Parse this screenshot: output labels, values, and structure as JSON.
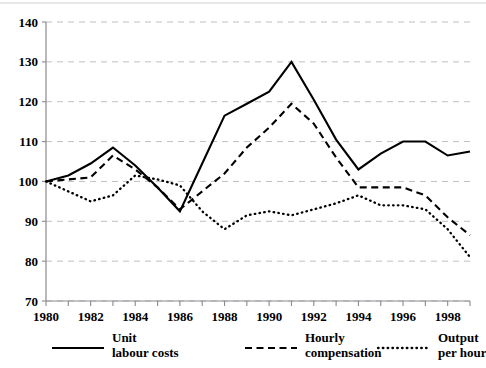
{
  "chart_data": {
    "type": "line",
    "title": "",
    "subtitle": "",
    "xlabel": "",
    "ylabel": "",
    "xlim": [
      1980,
      1999
    ],
    "ylim": [
      70,
      140
    ],
    "yticks": [
      70,
      80,
      90,
      100,
      110,
      120,
      130,
      140
    ],
    "xticks": [
      1980,
      1982,
      1984,
      1986,
      1988,
      1990,
      1992,
      1994,
      1996,
      1998
    ],
    "xtick_minor": [
      1981,
      1983,
      1985,
      1987,
      1989,
      1991,
      1993,
      1995,
      1997,
      1999
    ],
    "grid": true,
    "legend_position": "bottom",
    "x": [
      1980,
      1981,
      1982,
      1983,
      1984,
      1985,
      1986,
      1987,
      1988,
      1989,
      1990,
      1991,
      1992,
      1993,
      1994,
      1995,
      1996,
      1997,
      1998,
      1999
    ],
    "series": [
      {
        "name": "Unit labour costs",
        "style": "solid",
        "values": [
          100.0,
          101.5,
          104.5,
          108.5,
          104.0,
          98.5,
          92.5,
          104.5,
          116.5,
          119.5,
          122.5,
          130.0,
          120.5,
          110.5,
          103.0,
          107.0,
          110.0,
          110.0,
          106.5,
          107.5
        ]
      },
      {
        "name": "Hourly compensation",
        "style": "dashed",
        "values": [
          100.0,
          100.5,
          101.0,
          106.5,
          103.0,
          98.5,
          93.0,
          97.5,
          102.0,
          108.5,
          113.5,
          119.5,
          114.5,
          106.0,
          98.5,
          98.5,
          98.5,
          96.5,
          91.0,
          86.5
        ]
      },
      {
        "name": "Output per hour",
        "style": "dotted",
        "values": [
          100.0,
          97.5,
          95.0,
          96.5,
          101.5,
          100.5,
          99.0,
          92.5,
          88.0,
          91.5,
          92.5,
          91.5,
          93.0,
          94.5,
          96.5,
          94.0,
          94.0,
          93.0,
          88.0,
          81.0
        ]
      }
    ],
    "legend": [
      {
        "label_line1": "Unit",
        "label_line2": "labour costs",
        "style": "solid"
      },
      {
        "label_line1": "Hourly",
        "label_line2": "compensation",
        "style": "dashed"
      },
      {
        "label_line1": "Output",
        "label_line2": "per hour",
        "style": "dotted"
      }
    ]
  }
}
